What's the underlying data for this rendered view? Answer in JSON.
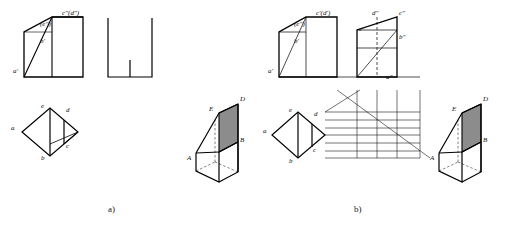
{
  "figure": {
    "title_a": "a)",
    "title_b": "b)"
  },
  "colors": {
    "line": "#000000",
    "shade": "#8c8c8c",
    "background": "#ffffff",
    "text": "#111111"
  },
  "panel_a": {
    "name": "a)",
    "front_view_labels": [
      {
        "id": "e-e-prime",
        "text": "(e\")",
        "x": 40,
        "y": 25
      },
      {
        "id": "c-d-prime",
        "text": "c\"(d\")",
        "x": 66,
        "y": 22
      },
      {
        "id": "b-prime",
        "text": "b'",
        "x": 40,
        "y": 42
      },
      {
        "id": "a-prime",
        "text": "a'",
        "x": 13,
        "y": 72
      }
    ],
    "top_view_labels": [
      {
        "id": "e-top",
        "text": "e",
        "x": 40,
        "y": 110
      },
      {
        "id": "d-top",
        "text": "d",
        "x": 67,
        "y": 110
      },
      {
        "id": "a-top",
        "text": "a",
        "x": 11,
        "y": 128
      },
      {
        "id": "c-top",
        "text": "c",
        "x": 66,
        "y": 146
      },
      {
        "id": "b-top",
        "text": "b",
        "x": 40,
        "y": 158
      }
    ],
    "pictorial_labels": [
      {
        "id": "E-pic",
        "text": "E",
        "x": 209,
        "y": 112
      },
      {
        "id": "D-pic",
        "text": "D",
        "x": 243,
        "y": 104
      },
      {
        "id": "B-pic",
        "text": "B",
        "x": 243,
        "y": 140
      },
      {
        "id": "A-pic",
        "text": "A",
        "x": 189,
        "y": 158
      }
    ]
  },
  "panel_b": {
    "name": "b)",
    "front_view_labels": [
      {
        "id": "e-e-prime",
        "text": "(e\")",
        "x": 288,
        "y": 25
      },
      {
        "id": "c-d-prime",
        "text": "c'(d')",
        "x": 312,
        "y": 22
      },
      {
        "id": "b-prime",
        "text": "b'",
        "x": 288,
        "y": 42
      },
      {
        "id": "a-prime",
        "text": "a'",
        "x": 268,
        "y": 72
      }
    ],
    "side_view_labels": [
      {
        "id": "d-dprime",
        "text": "d\"",
        "x": 370,
        "y": 22
      },
      {
        "id": "c-dprime",
        "text": "c\"",
        "x": 401,
        "y": 22
      },
      {
        "id": "e-dprime",
        "text": "e\"",
        "x": 357,
        "y": 38
      },
      {
        "id": "b-dprime",
        "text": "b\"",
        "x": 400,
        "y": 44
      },
      {
        "id": "a-dprime",
        "text": "a\"",
        "x": 389,
        "y": 78
      }
    ],
    "top_view_labels": [
      {
        "id": "e-top",
        "text": "e",
        "x": 289,
        "y": 112
      },
      {
        "id": "d-top",
        "text": "d",
        "x": 315,
        "y": 116
      },
      {
        "id": "a-top",
        "text": "a",
        "x": 265,
        "y": 130
      },
      {
        "id": "c-top",
        "text": "c",
        "x": 313,
        "y": 152
      },
      {
        "id": "b-top",
        "text": "b",
        "x": 289,
        "y": 164
      }
    ],
    "pictorial_labels": [
      {
        "id": "E-pic",
        "text": "E",
        "x": 452,
        "y": 112
      },
      {
        "id": "D-pic",
        "text": "D",
        "x": 486,
        "y": 104
      },
      {
        "id": "B-pic",
        "text": "B",
        "x": 486,
        "y": 140
      },
      {
        "id": "A-pic",
        "text": "A",
        "x": 431,
        "y": 158
      }
    ]
  }
}
